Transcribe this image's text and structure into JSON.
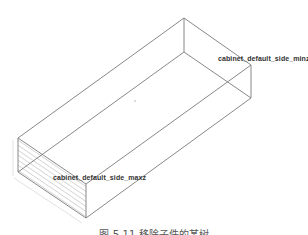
{
  "figure": {
    "type": "isometric wireframe box (cabinet side panel)",
    "labels": {
      "side_minz": "cabinet_default_side_minz",
      "side_maxz": "cabinet_default_side_maxz"
    },
    "caption": "图 5-11  移除子件的某树",
    "colors": {
      "edge": "#7a7a7a",
      "hatch": "#c8c8c8",
      "label_text": "#333333",
      "background": "#ffffff"
    },
    "vertices": {
      "back_top": [
        184,
        18
      ],
      "back_bottom": [
        184,
        52
      ],
      "right_top": [
        251,
        65
      ],
      "right_bottom": [
        251,
        98
      ],
      "left_top": [
        18,
        138
      ],
      "left_bottom": [
        18,
        172
      ],
      "front_top": [
        86,
        184
      ],
      "front_bottom": [
        86,
        218
      ]
    }
  }
}
